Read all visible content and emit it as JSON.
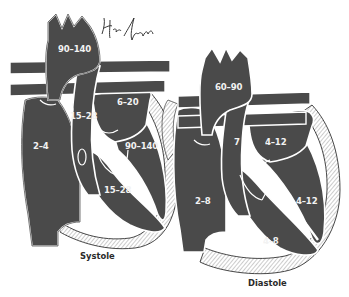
{
  "figure": {
    "type": "medical-illustration",
    "colors": {
      "chamber_fill": "#4a4a4a",
      "outline": "#ffffff",
      "edge": "#1a1a1a",
      "myocardium_hatch": "#bdbdbd",
      "label_text": "#f2f2f2",
      "caption_text": "#2a2a2a"
    }
  },
  "panels": [
    {
      "caption": "Systole",
      "labels": {
        "aorta": "90–140",
        "pulmonary_artery": "15–28",
        "left_atrium": "6–20",
        "right_atrium": "2–4",
        "left_ventricle": "90–140",
        "right_ventricle": "15–28"
      }
    },
    {
      "caption": "Diastole",
      "labels": {
        "aorta": "60–90",
        "pulmonary_artery": "7",
        "left_atrium": "4–12",
        "right_atrium": "2–8",
        "left_ventricle": "4–12",
        "right_ventricle": "4–8"
      }
    }
  ],
  "signature": "handwritten signature"
}
